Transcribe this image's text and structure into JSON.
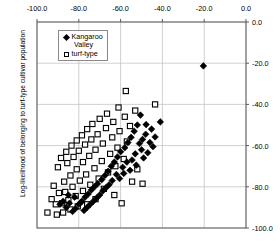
{
  "chart_data": {
    "type": "scatter",
    "title": "",
    "xlabel": "",
    "ylabel": "Log-likelihood of belonging to turf-type cultivar population",
    "xlim": [
      -100.0,
      0.0
    ],
    "ylim": [
      -100.0,
      0.0
    ],
    "x_axis_position": "top",
    "y_axis_position": "right",
    "grid": true,
    "legend_position": "top-left inside plot",
    "xticks": [
      "-100.0",
      "-80.0",
      "-60.0",
      "-40.0",
      "-20.0",
      "0.0"
    ],
    "xtick_values": [
      -100.0,
      -80.0,
      -60.0,
      -40.0,
      -20.0,
      0.0
    ],
    "yticks": [
      "0.0",
      "-20.0",
      "-40.0",
      "-60.0",
      "-80.0",
      "-100.0"
    ],
    "ytick_values": [
      0.0,
      -20.0,
      -40.0,
      -60.0,
      -80.0,
      -100.0
    ],
    "series": [
      {
        "name": "Kangaroo Valley",
        "marker": "filled-diamond",
        "color": "#000000",
        "points": [
          [
            -20.4,
            -21.3
          ],
          [
            -41.0,
            -48.5
          ],
          [
            -50.5,
            -45.2
          ],
          [
            -47.8,
            -49.8
          ],
          [
            -45.2,
            -52.0
          ],
          [
            -48.0,
            -54.5
          ],
          [
            -43.5,
            -55.8
          ],
          [
            -52.0,
            -50.0
          ],
          [
            -49.5,
            -57.0
          ],
          [
            -46.0,
            -58.5
          ],
          [
            -53.5,
            -53.0
          ],
          [
            -51.0,
            -59.0
          ],
          [
            -44.5,
            -60.5
          ],
          [
            -55.0,
            -56.0
          ],
          [
            -50.0,
            -62.0
          ],
          [
            -47.0,
            -63.5
          ],
          [
            -56.5,
            -58.5
          ],
          [
            -53.0,
            -64.0
          ],
          [
            -58.0,
            -61.0
          ],
          [
            -49.0,
            -66.0
          ],
          [
            -54.5,
            -67.0
          ],
          [
            -60.0,
            -63.0
          ],
          [
            -57.0,
            -68.0
          ],
          [
            -52.5,
            -69.5
          ],
          [
            -61.5,
            -65.5
          ],
          [
            -59.0,
            -70.5
          ],
          [
            -55.5,
            -72.0
          ],
          [
            -63.0,
            -68.0
          ],
          [
            -58.5,
            -73.5
          ],
          [
            -64.5,
            -70.0
          ],
          [
            -62.0,
            -74.0
          ],
          [
            -66.0,
            -72.5
          ],
          [
            -60.5,
            -76.0
          ],
          [
            -67.5,
            -74.5
          ],
          [
            -64.0,
            -77.0
          ],
          [
            -69.0,
            -76.5
          ],
          [
            -65.5,
            -79.0
          ],
          [
            -71.0,
            -78.5
          ],
          [
            -67.0,
            -80.5
          ],
          [
            -72.5,
            -80.0
          ],
          [
            -68.5,
            -82.0
          ],
          [
            -74.0,
            -81.5
          ],
          [
            -70.0,
            -84.0
          ],
          [
            -75.5,
            -83.5
          ],
          [
            -71.5,
            -85.5
          ],
          [
            -77.0,
            -85.0
          ],
          [
            -73.0,
            -87.0
          ],
          [
            -78.5,
            -87.0
          ],
          [
            -74.5,
            -88.5
          ],
          [
            -80.0,
            -88.5
          ],
          [
            -76.0,
            -90.0
          ],
          [
            -81.5,
            -90.5
          ],
          [
            -77.5,
            -91.5
          ],
          [
            -79.0,
            -87.5
          ],
          [
            -83.0,
            -92.0
          ],
          [
            -84.5,
            -88.0
          ],
          [
            -86.0,
            -90.0
          ],
          [
            -87.5,
            -87.0
          ],
          [
            -89.0,
            -88.5
          ],
          [
            -82.0,
            -85.0
          ],
          [
            -85.0,
            -84.0
          ]
        ]
      },
      {
        "name": "turf-type",
        "marker": "open-square",
        "color": "#000000",
        "points": [
          [
            -57.5,
            -33.5
          ],
          [
            -43.5,
            -40.0
          ],
          [
            -53.0,
            -43.0
          ],
          [
            -61.0,
            -41.5
          ],
          [
            -66.5,
            -44.5
          ],
          [
            -58.0,
            -46.0
          ],
          [
            -70.0,
            -47.0
          ],
          [
            -63.5,
            -48.5
          ],
          [
            -73.5,
            -49.5
          ],
          [
            -55.5,
            -50.5
          ],
          [
            -67.0,
            -51.5
          ],
          [
            -76.0,
            -52.0
          ],
          [
            -60.5,
            -53.0
          ],
          [
            -71.0,
            -54.5
          ],
          [
            -78.5,
            -55.0
          ],
          [
            -64.0,
            -56.0
          ],
          [
            -74.0,
            -57.0
          ],
          [
            -81.0,
            -57.5
          ],
          [
            -57.0,
            -58.0
          ],
          [
            -68.5,
            -59.0
          ],
          [
            -77.0,
            -59.5
          ],
          [
            -83.5,
            -60.0
          ],
          [
            -61.5,
            -61.0
          ],
          [
            -72.0,
            -62.0
          ],
          [
            -80.0,
            -62.5
          ],
          [
            -86.0,
            -63.0
          ],
          [
            -65.0,
            -64.0
          ],
          [
            -75.0,
            -65.0
          ],
          [
            -82.5,
            -65.5
          ],
          [
            -88.5,
            -66.0
          ],
          [
            -58.5,
            -66.5
          ],
          [
            -69.0,
            -67.5
          ],
          [
            -78.0,
            -68.0
          ],
          [
            -85.5,
            -68.5
          ],
          [
            -62.5,
            -70.0
          ],
          [
            -72.5,
            -71.0
          ],
          [
            -81.0,
            -71.5
          ],
          [
            -90.0,
            -70.5
          ],
          [
            -66.0,
            -73.0
          ],
          [
            -76.5,
            -74.0
          ],
          [
            -84.0,
            -74.5
          ],
          [
            -70.5,
            -76.0
          ],
          [
            -79.5,
            -77.0
          ],
          [
            -87.0,
            -77.5
          ],
          [
            -74.5,
            -79.0
          ],
          [
            -83.0,
            -80.0
          ],
          [
            -92.0,
            -79.5
          ],
          [
            -78.0,
            -82.0
          ],
          [
            -86.5,
            -82.5
          ],
          [
            -68.0,
            -81.0
          ],
          [
            -81.5,
            -84.5
          ],
          [
            -89.5,
            -83.0
          ],
          [
            -63.0,
            -84.0
          ],
          [
            -85.0,
            -86.5
          ],
          [
            -93.0,
            -86.0
          ],
          [
            -72.0,
            -86.0
          ],
          [
            -88.0,
            -88.0
          ],
          [
            -76.0,
            -88.5
          ],
          [
            -91.0,
            -88.5
          ],
          [
            -59.5,
            -88.0
          ],
          [
            -80.5,
            -89.5
          ],
          [
            -95.0,
            -92.5
          ],
          [
            -84.0,
            -91.0
          ],
          [
            -87.5,
            -92.5
          ],
          [
            -90.5,
            -93.5
          ],
          [
            -52.0,
            -71.5
          ],
          [
            -54.5,
            -77.5
          ],
          [
            -49.5,
            -78.5
          ]
        ]
      }
    ]
  },
  "legend": {
    "entries": [
      {
        "label": "Kangaroo",
        "symbol": "filled-diamond"
      },
      {
        "label": "Valley",
        "symbol": "none"
      },
      {
        "label": "turf-type",
        "symbol": "open-square"
      }
    ]
  }
}
